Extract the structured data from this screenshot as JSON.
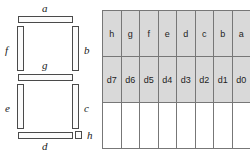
{
  "figure": {
    "caption": ""
  },
  "segment_display": {
    "name": "seven-segment-display",
    "segments": [
      {
        "id": "a",
        "label": "a",
        "orientation": "horizontal",
        "position": "top"
      },
      {
        "id": "b",
        "label": "b",
        "orientation": "vertical",
        "position": "upper-right"
      },
      {
        "id": "c",
        "label": "c",
        "orientation": "vertical",
        "position": "lower-right"
      },
      {
        "id": "d",
        "label": "d",
        "orientation": "horizontal",
        "position": "bottom"
      },
      {
        "id": "e",
        "label": "e",
        "orientation": "vertical",
        "position": "lower-left"
      },
      {
        "id": "f",
        "label": "f",
        "orientation": "vertical",
        "position": "upper-left"
      },
      {
        "id": "g",
        "label": "g",
        "orientation": "horizontal",
        "position": "middle"
      },
      {
        "id": "h",
        "label": "h",
        "orientation": "dot",
        "position": "decimal-point"
      }
    ],
    "labels": {
      "a": "a",
      "b": "b",
      "c": "c",
      "d": "d",
      "e": "e",
      "f": "f",
      "g": "g",
      "h": "h"
    }
  },
  "bit_table": {
    "name": "segment-to-bit-mapping-table",
    "columns": 8,
    "rows": [
      {
        "id": "segment-names",
        "shaded": true,
        "cells": [
          "h",
          "g",
          "f",
          "e",
          "d",
          "c",
          "b",
          "a"
        ]
      },
      {
        "id": "bit-names",
        "shaded": true,
        "cells": [
          "d7",
          "d6",
          "d5",
          "d4",
          "d3",
          "d2",
          "d1",
          "d0"
        ]
      },
      {
        "id": "blank",
        "shaded": false,
        "cells": [
          "",
          "",
          "",
          "",
          "",
          "",
          "",
          ""
        ]
      }
    ]
  },
  "colors": {
    "segment_fill": "#fbfbfb",
    "segment_stroke": "#4a4a4a",
    "table_shaded": "#d9d9d9",
    "table_blank": "#ffffff",
    "table_border": "#777777",
    "text": "#1d1d1d"
  }
}
